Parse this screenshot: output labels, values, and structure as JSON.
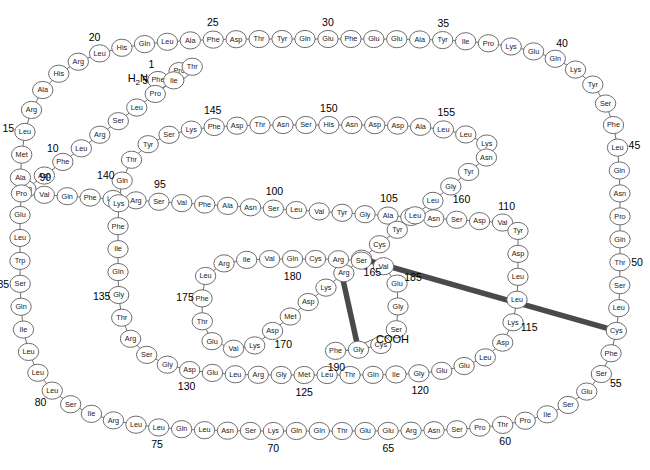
{
  "figure": {
    "type": "protein-sequence-spiral-diagram",
    "n_terminus_label": "H2N",
    "n_terminus_html": "H₂N",
    "c_terminus_label": "COOH",
    "total_residues": 191,
    "numbering_interval": 5,
    "circle_fill": "#ffffff",
    "circle_stroke": "#6e6e6e",
    "bond_color": "#4a4a4a",
    "text_color": "#1a1a1a"
  },
  "disulfide_bonds": [
    {
      "from": 53,
      "to": 165,
      "label": "Cys-Cys"
    },
    {
      "from": 182,
      "to": 189,
      "label": "Cys-Cys"
    }
  ],
  "number_ticks": [
    1,
    5,
    10,
    15,
    20,
    25,
    30,
    35,
    40,
    45,
    50,
    55,
    60,
    65,
    70,
    75,
    80,
    85,
    90,
    95,
    100,
    105,
    110,
    115,
    120,
    125,
    130,
    135,
    140,
    145,
    150,
    155,
    160,
    165,
    170,
    175,
    180,
    185,
    190
  ],
  "sequence": [
    {
      "pos": 1,
      "aa": "Phe"
    },
    {
      "pos": 2,
      "aa": "Pro"
    },
    {
      "pos": 3,
      "aa": "Thr"
    },
    {
      "pos": 4,
      "aa": "Ile"
    },
    {
      "pos": 5,
      "aa": "Pro"
    },
    {
      "pos": 6,
      "aa": "Leu"
    },
    {
      "pos": 7,
      "aa": "Ser"
    },
    {
      "pos": 8,
      "aa": "Arg"
    },
    {
      "pos": 9,
      "aa": "Leu"
    },
    {
      "pos": 10,
      "aa": "Phe"
    },
    {
      "pos": 11,
      "aa": "Asp"
    },
    {
      "pos": 12,
      "aa": "Asn"
    },
    {
      "pos": 13,
      "aa": "Ala"
    },
    {
      "pos": 14,
      "aa": "Met"
    },
    {
      "pos": 15,
      "aa": "Leu"
    },
    {
      "pos": 16,
      "aa": "Arg"
    },
    {
      "pos": 17,
      "aa": "Ala"
    },
    {
      "pos": 18,
      "aa": "His"
    },
    {
      "pos": 19,
      "aa": "Arg"
    },
    {
      "pos": 20,
      "aa": "Leu"
    },
    {
      "pos": 21,
      "aa": "His"
    },
    {
      "pos": 22,
      "aa": "Gln"
    },
    {
      "pos": 23,
      "aa": "Leu"
    },
    {
      "pos": 24,
      "aa": "Ala"
    },
    {
      "pos": 25,
      "aa": "Phe"
    },
    {
      "pos": 26,
      "aa": "Asp"
    },
    {
      "pos": 27,
      "aa": "Thr"
    },
    {
      "pos": 28,
      "aa": "Tyr"
    },
    {
      "pos": 29,
      "aa": "Gln"
    },
    {
      "pos": 30,
      "aa": "Glu"
    },
    {
      "pos": 31,
      "aa": "Phe"
    },
    {
      "pos": 32,
      "aa": "Glu"
    },
    {
      "pos": 33,
      "aa": "Glu"
    },
    {
      "pos": 34,
      "aa": "Ala"
    },
    {
      "pos": 35,
      "aa": "Tyr"
    },
    {
      "pos": 36,
      "aa": "Ile"
    },
    {
      "pos": 37,
      "aa": "Pro"
    },
    {
      "pos": 38,
      "aa": "Lys"
    },
    {
      "pos": 39,
      "aa": "Glu"
    },
    {
      "pos": 40,
      "aa": "Gln"
    },
    {
      "pos": 41,
      "aa": "Lys"
    },
    {
      "pos": 42,
      "aa": "Tyr"
    },
    {
      "pos": 43,
      "aa": "Ser"
    },
    {
      "pos": 44,
      "aa": "Phe"
    },
    {
      "pos": 45,
      "aa": "Leu"
    },
    {
      "pos": 46,
      "aa": "Gln"
    },
    {
      "pos": 47,
      "aa": "Asn"
    },
    {
      "pos": 48,
      "aa": "Pro"
    },
    {
      "pos": 49,
      "aa": "Gln"
    },
    {
      "pos": 50,
      "aa": "Thr"
    },
    {
      "pos": 51,
      "aa": "Ser"
    },
    {
      "pos": 52,
      "aa": "Leu"
    },
    {
      "pos": 53,
      "aa": "Cys"
    },
    {
      "pos": 54,
      "aa": "Phe"
    },
    {
      "pos": 55,
      "aa": "Ser"
    },
    {
      "pos": 56,
      "aa": "Glu"
    },
    {
      "pos": 57,
      "aa": "Ser"
    },
    {
      "pos": 58,
      "aa": "Ile"
    },
    {
      "pos": 59,
      "aa": "Pro"
    },
    {
      "pos": 60,
      "aa": "Thr"
    },
    {
      "pos": 61,
      "aa": "Pro"
    },
    {
      "pos": 62,
      "aa": "Ser"
    },
    {
      "pos": 63,
      "aa": "Asn"
    },
    {
      "pos": 64,
      "aa": "Arg"
    },
    {
      "pos": 65,
      "aa": "Glu"
    },
    {
      "pos": 66,
      "aa": "Glu"
    },
    {
      "pos": 67,
      "aa": "Thr"
    },
    {
      "pos": 68,
      "aa": "Gln"
    },
    {
      "pos": 69,
      "aa": "Gln"
    },
    {
      "pos": 70,
      "aa": "Lys"
    },
    {
      "pos": 71,
      "aa": "Ser"
    },
    {
      "pos": 72,
      "aa": "Asn"
    },
    {
      "pos": 73,
      "aa": "Leu"
    },
    {
      "pos": 74,
      "aa": "Gln"
    },
    {
      "pos": 75,
      "aa": "Leu"
    },
    {
      "pos": 76,
      "aa": "Leu"
    },
    {
      "pos": 77,
      "aa": "Arg"
    },
    {
      "pos": 78,
      "aa": "Ile"
    },
    {
      "pos": 79,
      "aa": "Ser"
    },
    {
      "pos": 80,
      "aa": "Leu"
    },
    {
      "pos": 81,
      "aa": "Leu"
    },
    {
      "pos": 82,
      "aa": "Leu"
    },
    {
      "pos": 83,
      "aa": "Ile"
    },
    {
      "pos": 84,
      "aa": "Gln"
    },
    {
      "pos": 85,
      "aa": "Ser"
    },
    {
      "pos": 86,
      "aa": "Trp"
    },
    {
      "pos": 87,
      "aa": "Leu"
    },
    {
      "pos": 88,
      "aa": "Glu"
    },
    {
      "pos": 89,
      "aa": "Pro"
    },
    {
      "pos": 90,
      "aa": "Val"
    },
    {
      "pos": 91,
      "aa": "Gln"
    },
    {
      "pos": 92,
      "aa": "Phe"
    },
    {
      "pos": 93,
      "aa": "Leu"
    },
    {
      "pos": 94,
      "aa": "Arg"
    },
    {
      "pos": 95,
      "aa": "Ser"
    },
    {
      "pos": 96,
      "aa": "Val"
    },
    {
      "pos": 97,
      "aa": "Phe"
    },
    {
      "pos": 98,
      "aa": "Ala"
    },
    {
      "pos": 99,
      "aa": "Asn"
    },
    {
      "pos": 100,
      "aa": "Ser"
    },
    {
      "pos": 101,
      "aa": "Leu"
    },
    {
      "pos": 102,
      "aa": "Val"
    },
    {
      "pos": 103,
      "aa": "Tyr"
    },
    {
      "pos": 104,
      "aa": "Gly"
    },
    {
      "pos": 105,
      "aa": "Ala"
    },
    {
      "pos": 106,
      "aa": "Ser"
    },
    {
      "pos": 107,
      "aa": "Asn"
    },
    {
      "pos": 108,
      "aa": "Ser"
    },
    {
      "pos": 109,
      "aa": "Asp"
    },
    {
      "pos": 110,
      "aa": "Val"
    },
    {
      "pos": 111,
      "aa": "Tyr"
    },
    {
      "pos": 112,
      "aa": "Asp"
    },
    {
      "pos": 113,
      "aa": "Leu"
    },
    {
      "pos": 114,
      "aa": "Leu"
    },
    {
      "pos": 115,
      "aa": "Lys"
    },
    {
      "pos": 116,
      "aa": "Asp"
    },
    {
      "pos": 117,
      "aa": "Leu"
    },
    {
      "pos": 118,
      "aa": "Glu"
    },
    {
      "pos": 119,
      "aa": "Glu"
    },
    {
      "pos": 120,
      "aa": "Gly"
    },
    {
      "pos": 121,
      "aa": "Ile"
    },
    {
      "pos": 122,
      "aa": "Gln"
    },
    {
      "pos": 123,
      "aa": "Thr"
    },
    {
      "pos": 124,
      "aa": "Leu"
    },
    {
      "pos": 125,
      "aa": "Met"
    },
    {
      "pos": 126,
      "aa": "Gly"
    },
    {
      "pos": 127,
      "aa": "Arg"
    },
    {
      "pos": 128,
      "aa": "Leu"
    },
    {
      "pos": 129,
      "aa": "Glu"
    },
    {
      "pos": 130,
      "aa": "Asp"
    },
    {
      "pos": 131,
      "aa": "Gly"
    },
    {
      "pos": 132,
      "aa": "Ser"
    },
    {
      "pos": 133,
      "aa": "Arg"
    },
    {
      "pos": 134,
      "aa": "Thr"
    },
    {
      "pos": 135,
      "aa": "Gly"
    },
    {
      "pos": 136,
      "aa": "Gln"
    },
    {
      "pos": 137,
      "aa": "Ile"
    },
    {
      "pos": 138,
      "aa": "Phe"
    },
    {
      "pos": 139,
      "aa": "Lys"
    },
    {
      "pos": 140,
      "aa": "Gln"
    },
    {
      "pos": 141,
      "aa": "Thr"
    },
    {
      "pos": 142,
      "aa": "Tyr"
    },
    {
      "pos": 143,
      "aa": "Ser"
    },
    {
      "pos": 144,
      "aa": "Lys"
    },
    {
      "pos": 145,
      "aa": "Phe"
    },
    {
      "pos": 146,
      "aa": "Asp"
    },
    {
      "pos": 147,
      "aa": "Thr"
    },
    {
      "pos": 148,
      "aa": "Asn"
    },
    {
      "pos": 149,
      "aa": "Ser"
    },
    {
      "pos": 150,
      "aa": "His"
    },
    {
      "pos": 151,
      "aa": "Asn"
    },
    {
      "pos": 152,
      "aa": "Asp"
    },
    {
      "pos": 153,
      "aa": "Asp"
    },
    {
      "pos": 154,
      "aa": "Ala"
    },
    {
      "pos": 155,
      "aa": "Leu"
    },
    {
      "pos": 156,
      "aa": "Leu"
    },
    {
      "pos": 157,
      "aa": "Lys"
    },
    {
      "pos": 158,
      "aa": "Asn"
    },
    {
      "pos": 159,
      "aa": "Tyr"
    },
    {
      "pos": 160,
      "aa": "Gly"
    },
    {
      "pos": 161,
      "aa": "Leu"
    },
    {
      "pos": 162,
      "aa": "Leu"
    },
    {
      "pos": 163,
      "aa": "Tyr"
    },
    {
      "pos": 164,
      "aa": "Cys"
    },
    {
      "pos": 165,
      "aa": "Phe"
    },
    {
      "pos": 166,
      "aa": "Arg"
    },
    {
      "pos": 167,
      "aa": "Lys"
    },
    {
      "pos": 168,
      "aa": "Asp"
    },
    {
      "pos": 169,
      "aa": "Met"
    },
    {
      "pos": 170,
      "aa": "Asp"
    },
    {
      "pos": 171,
      "aa": "Lys"
    },
    {
      "pos": 172,
      "aa": "Val"
    },
    {
      "pos": 173,
      "aa": "Glu"
    },
    {
      "pos": 174,
      "aa": "Thr"
    },
    {
      "pos": 175,
      "aa": "Phe"
    },
    {
      "pos": 176,
      "aa": "Leu"
    },
    {
      "pos": 177,
      "aa": "Arg"
    },
    {
      "pos": 178,
      "aa": "Ile"
    },
    {
      "pos": 179,
      "aa": "Val"
    },
    {
      "pos": 180,
      "aa": "Gln"
    },
    {
      "pos": 181,
      "aa": "Cys"
    },
    {
      "pos": 182,
      "aa": "Arg"
    },
    {
      "pos": 183,
      "aa": "Ser"
    },
    {
      "pos": 184,
      "aa": "Val"
    },
    {
      "pos": 185,
      "aa": "Glu"
    },
    {
      "pos": 186,
      "aa": "Gly"
    },
    {
      "pos": 187,
      "aa": "Ser"
    },
    {
      "pos": 188,
      "aa": "Cys"
    },
    {
      "pos": 189,
      "aa": "Gly"
    },
    {
      "pos": 190,
      "aa": "Phe"
    }
  ]
}
